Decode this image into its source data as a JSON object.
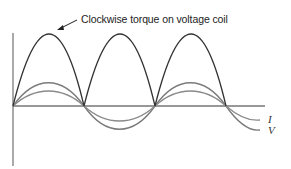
{
  "diagram": {
    "annotation": "Clockwise torque on voltage coil",
    "series": [
      {
        "name": "torque",
        "label": "",
        "color": "#3a3a3a",
        "shape": "rectified sine |sin|",
        "peaks": 3
      },
      {
        "name": "voltage",
        "label": "V",
        "color": "#777777",
        "shape": "sine",
        "relative_amplitude": 0.33
      },
      {
        "name": "current",
        "label": "I",
        "color": "#888888",
        "shape": "sine",
        "relative_amplitude": 0.2
      }
    ],
    "axes": {
      "vertical": true,
      "horizontal": true,
      "zero_crossings": 4
    }
  }
}
